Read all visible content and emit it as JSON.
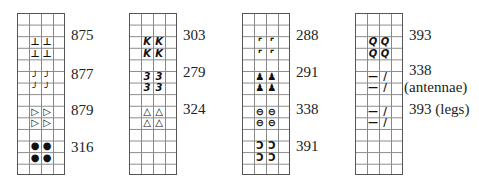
{
  "charts": [
    {
      "left": 17,
      "blocks": [
        {
          "row": 2,
          "symbol": "⊥",
          "label": "875",
          "label_top": 28
        },
        {
          "row": 5,
          "symbol": "╯",
          "label": "877",
          "label_top": 67
        },
        {
          "row": 8,
          "symbol": "▷",
          "label": "879",
          "label_top": 103
        },
        {
          "row": 11,
          "symbol": "●",
          "label": "316",
          "label_top": 140
        }
      ]
    },
    {
      "left": 129,
      "blocks": [
        {
          "row": 2,
          "symbol": "K",
          "label": "303",
          "label_top": 28
        },
        {
          "row": 5,
          "symbol": "3",
          "label": "279",
          "label_top": 65
        },
        {
          "row": 8,
          "symbol": "△",
          "label": "324",
          "label_top": 102
        }
      ]
    },
    {
      "left": 242,
      "blocks": [
        {
          "row": 2,
          "symbol": "⌜",
          "label": "288",
          "label_top": 28
        },
        {
          "row": 5,
          "symbol": "♟",
          "label": "291",
          "label_top": 65
        },
        {
          "row": 8,
          "symbol": "⊖",
          "label": "338",
          "label_top": 102
        },
        {
          "row": 11,
          "symbol": "Ↄ",
          "label": "391",
          "label_top": 139
        }
      ]
    },
    {
      "left": 355,
      "blocks": [
        {
          "row": 2,
          "symbol": "Q",
          "label": "393",
          "label_top": 28
        },
        {
          "row": 5,
          "symbols": [
            "—",
            "/"
          ],
          "label": "338",
          "sublabel": "(antennae)",
          "label_top": 63
        },
        {
          "row": 8,
          "symbols": [
            "—",
            "/"
          ],
          "label": "393 (legs)",
          "label_top": 102
        }
      ]
    }
  ]
}
